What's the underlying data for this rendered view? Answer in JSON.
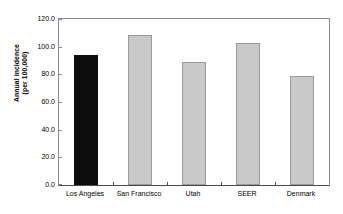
{
  "chart_data": {
    "type": "bar",
    "title": "",
    "subtitle": "",
    "xlabel": "",
    "ylabel": "Annual incidence (per 100,000)",
    "ylabel_lines": [
      "Annual incidence",
      "(per 100,000)"
    ],
    "categories": [
      "Los Angeles",
      "San Francisco",
      "Utah",
      "SEER",
      "Denmark"
    ],
    "values": [
      94.0,
      108.5,
      89.0,
      102.5,
      79.0
    ],
    "ylim": [
      0.0,
      120.0
    ],
    "ytick_labels": [
      "0.0",
      "20.0",
      "40.0",
      "60.0",
      "80.0",
      "100.0",
      "120.0"
    ],
    "ytick_values": [
      0,
      20,
      40,
      60,
      80,
      100,
      120
    ],
    "grid": false,
    "legend": "none",
    "bar_colors": [
      "#0c0c0c",
      "#c9c9c9",
      "#c9c9c9",
      "#c9c9c9",
      "#c9c9c9"
    ],
    "bar_border_colors": [
      "#0c0c0c",
      "#9a9a9a",
      "#9a9a9a",
      "#9a9a9a",
      "#9a9a9a"
    ],
    "highlighted_category": "Los Angeles",
    "axis_color": "#8a8a8a",
    "baseline_color": "#4a4a4a",
    "background_color": "#ffffff",
    "text_color": "#000000"
  }
}
